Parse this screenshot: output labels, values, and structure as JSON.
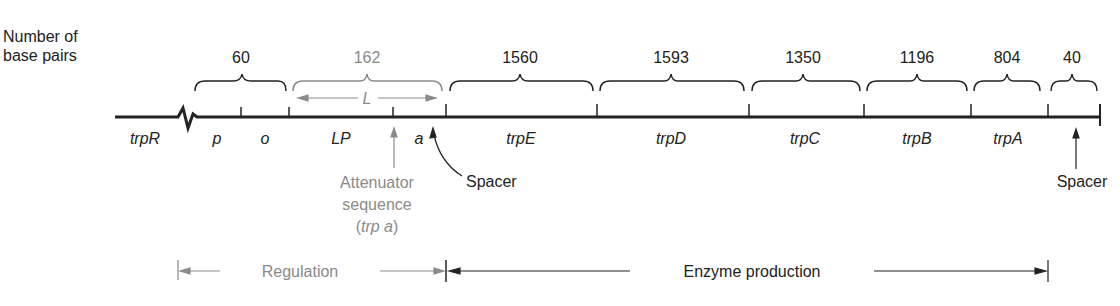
{
  "axis_label": {
    "line1": "Number of",
    "line2": "base pairs"
  },
  "segments": [
    {
      "length": "60",
      "color": "#222222"
    },
    {
      "length": "162",
      "color": "#8a8a8a",
      "inner": "L"
    },
    {
      "length": "1560",
      "color": "#222222"
    },
    {
      "length": "1593",
      "color": "#222222"
    },
    {
      "length": "1350",
      "color": "#222222"
    },
    {
      "length": "1196",
      "color": "#222222"
    },
    {
      "length": "804",
      "color": "#222222"
    },
    {
      "length": "40",
      "color": "#222222"
    }
  ],
  "genes": {
    "trpR": "trpR",
    "p": "p",
    "o": "o",
    "LP": "LP",
    "a": "a",
    "trpE": "trpE",
    "trpD": "trpD",
    "trpC": "trpC",
    "trpB": "trpB",
    "trpA": "trpA"
  },
  "annotations": {
    "attenuator_line1": "Attenuator",
    "attenuator_line2": "sequence",
    "attenuator_line3_pre": "(",
    "attenuator_line3_it": "trp a",
    "attenuator_line3_post": ")",
    "spacer_left": "Spacer",
    "spacer_right": "Spacer"
  },
  "regions": {
    "regulation": "Regulation",
    "enzyme_production": "Enzyme production"
  },
  "colors": {
    "ink": "#222222",
    "gray": "#8a8a8a"
  }
}
